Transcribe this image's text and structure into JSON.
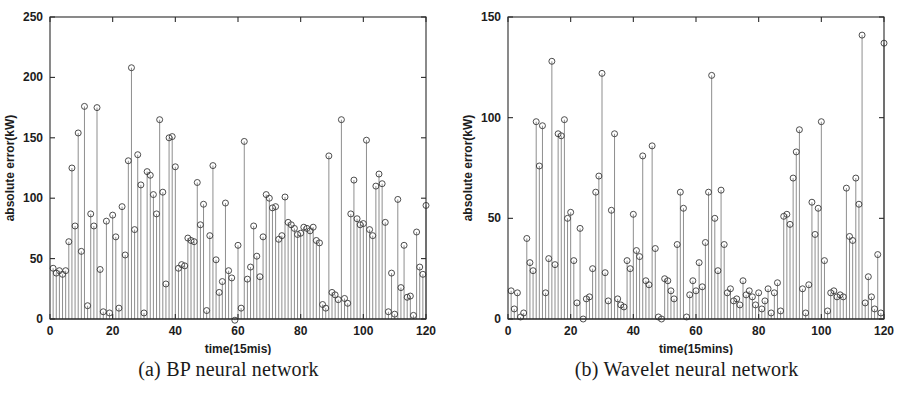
{
  "figure": {
    "panels": [
      {
        "id": "a",
        "caption": "(a) BP neural network",
        "chart_data": {
          "type": "line",
          "style": "stem",
          "title": "",
          "xlabel": "time(15mis)",
          "ylabel": "absolute error(kW)",
          "xlim": [
            0,
            120
          ],
          "ylim": [
            0,
            250
          ],
          "xticks": [
            0,
            20,
            40,
            60,
            80,
            100,
            120
          ],
          "yticks": [
            0,
            50,
            100,
            150,
            200,
            250
          ],
          "xtick_labels": [
            "0",
            "20",
            "40",
            "60",
            "80",
            "100",
            "120"
          ],
          "ytick_labels": [
            "0",
            "50",
            "100",
            "150",
            "200",
            "250"
          ],
          "grid": false,
          "legend": "none",
          "marker": "open-circle",
          "x": [
            1,
            2,
            3,
            4,
            5,
            6,
            7,
            8,
            9,
            10,
            11,
            12,
            13,
            14,
            15,
            16,
            17,
            18,
            19,
            20,
            21,
            22,
            23,
            24,
            25,
            26,
            27,
            28,
            29,
            30,
            31,
            32,
            33,
            34,
            35,
            36,
            37,
            38,
            39,
            40,
            41,
            42,
            43,
            44,
            45,
            46,
            47,
            48,
            49,
            50,
            51,
            52,
            53,
            54,
            55,
            56,
            57,
            58,
            59,
            60,
            61,
            62,
            63,
            64,
            65,
            66,
            67,
            68,
            69,
            70,
            71,
            72,
            73,
            74,
            75,
            76,
            77,
            78,
            79,
            80,
            81,
            82,
            83,
            84,
            85,
            86,
            87,
            88,
            89,
            90,
            91,
            92,
            93,
            94,
            95,
            96,
            97,
            98,
            99,
            100,
            101,
            102,
            103,
            104,
            105,
            106,
            107,
            108,
            109,
            110,
            111,
            112,
            113,
            114,
            115,
            116,
            117,
            118,
            119,
            120
          ],
          "values": [
            42,
            38,
            40,
            37,
            40,
            64,
            125,
            77,
            154,
            56,
            176,
            11,
            87,
            77,
            175,
            41,
            6,
            81,
            5,
            86,
            68,
            9,
            93,
            53,
            131,
            208,
            74,
            136,
            111,
            5,
            122,
            119,
            103,
            87,
            165,
            105,
            29,
            150,
            151,
            126,
            42,
            45,
            44,
            67,
            65,
            64,
            113,
            78,
            95,
            7,
            69,
            127,
            49,
            22,
            31,
            96,
            40,
            34,
            -1,
            61,
            9,
            147,
            33,
            43,
            77,
            52,
            35,
            68,
            103,
            100,
            92,
            93,
            66,
            69,
            101,
            80,
            78,
            75,
            70,
            71,
            76,
            75,
            73,
            76,
            65,
            63,
            12,
            9,
            135,
            22,
            20,
            16,
            165,
            17,
            13,
            87,
            115,
            83,
            78,
            79,
            148,
            74,
            69,
            110,
            120,
            112,
            80,
            6,
            38,
            4,
            99,
            26,
            61,
            18,
            19,
            3,
            72,
            43,
            37,
            94
          ]
        }
      },
      {
        "id": "b",
        "caption": "(b) Wavelet neural network",
        "chart_data": {
          "type": "line",
          "style": "stem",
          "title": "",
          "xlabel": "time(15mins)",
          "ylabel": "absolute error(kW)",
          "xlim": [
            0,
            120
          ],
          "ylim": [
            0,
            150
          ],
          "xticks": [
            0,
            20,
            40,
            60,
            80,
            100,
            120
          ],
          "yticks": [
            0,
            50,
            100,
            150
          ],
          "xtick_labels": [
            "0",
            "20",
            "40",
            "60",
            "80",
            "100",
            "120"
          ],
          "ytick_labels": [
            "0",
            "50",
            "100",
            "150"
          ],
          "grid": false,
          "legend": "none",
          "marker": "open-circle",
          "x": [
            1,
            2,
            3,
            4,
            5,
            6,
            7,
            8,
            9,
            10,
            11,
            12,
            13,
            14,
            15,
            16,
            17,
            18,
            19,
            20,
            21,
            22,
            23,
            24,
            25,
            26,
            27,
            28,
            29,
            30,
            31,
            32,
            33,
            34,
            35,
            36,
            37,
            38,
            39,
            40,
            41,
            42,
            43,
            44,
            45,
            46,
            47,
            48,
            49,
            50,
            51,
            52,
            53,
            54,
            55,
            56,
            57,
            58,
            59,
            60,
            61,
            62,
            63,
            64,
            65,
            66,
            67,
            68,
            69,
            70,
            71,
            72,
            73,
            74,
            75,
            76,
            77,
            78,
            79,
            80,
            81,
            82,
            83,
            84,
            85,
            86,
            87,
            88,
            89,
            90,
            91,
            92,
            93,
            94,
            95,
            96,
            97,
            98,
            99,
            100,
            101,
            102,
            103,
            104,
            105,
            106,
            107,
            108,
            109,
            110,
            111,
            112,
            113,
            114,
            115,
            116,
            117,
            118,
            119,
            120
          ],
          "values": [
            14,
            5,
            13,
            1,
            3,
            40,
            28,
            24,
            98,
            76,
            96,
            13,
            30,
            128,
            27,
            92,
            91,
            99,
            50,
            53,
            29,
            8,
            45,
            0,
            10,
            11,
            25,
            63,
            71,
            122,
            23,
            9,
            54,
            92,
            10,
            7,
            6,
            29,
            25,
            52,
            34,
            31,
            81,
            19,
            17,
            86,
            35,
            1,
            0,
            20,
            19,
            14,
            10,
            37,
            63,
            55,
            1,
            12,
            19,
            14,
            28,
            16,
            38,
            63,
            121,
            50,
            24,
            64,
            37,
            13,
            15,
            9,
            10,
            7,
            19,
            12,
            14,
            11,
            7,
            13,
            5,
            9,
            15,
            3,
            13,
            18,
            4,
            51,
            52,
            47,
            70,
            83,
            94,
            15,
            3,
            17,
            58,
            42,
            55,
            98,
            29,
            4,
            13,
            14,
            11,
            12,
            11,
            65,
            41,
            39,
            70,
            57,
            141,
            8,
            21,
            11,
            5,
            32,
            3,
            137
          ]
        }
      }
    ]
  }
}
